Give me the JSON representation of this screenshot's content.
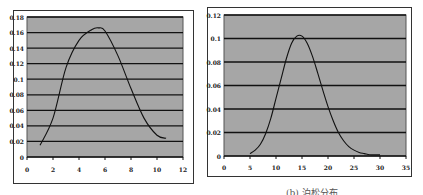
{
  "chart_data": [
    {
      "type": "line",
      "title": "",
      "xlabel": "",
      "ylabel": "",
      "xlim": [
        0,
        12
      ],
      "ylim": [
        0,
        0.18
      ],
      "x_ticks": [
        "0",
        "2",
        "4",
        "6",
        "8",
        "10",
        "12"
      ],
      "y_ticks": [
        "0",
        "0.02",
        "0.04",
        "0.06",
        "0.08",
        "0.1",
        "0.12",
        "0.14",
        "0.16",
        "0.18"
      ],
      "grid": "horizontal",
      "background": "#a6a6a6",
      "series": [
        {
          "name": "",
          "x": [
            1,
            2,
            3,
            4,
            5,
            5.5,
            6,
            7,
            8,
            9,
            10,
            10.7
          ],
          "values": [
            0.015,
            0.05,
            0.115,
            0.15,
            0.164,
            0.166,
            0.162,
            0.13,
            0.088,
            0.05,
            0.028,
            0.024
          ]
        }
      ]
    },
    {
      "type": "line",
      "title": "",
      "xlabel": "",
      "ylabel": "",
      "xlim": [
        0,
        35
      ],
      "ylim": [
        0,
        0.12
      ],
      "x_ticks": [
        "0",
        "5",
        "10",
        "15",
        "20",
        "25",
        "30",
        "35"
      ],
      "y_ticks": [
        "0",
        "0.02",
        "0.04",
        "0.06",
        "0.08",
        "0.1",
        "0.12"
      ],
      "grid": "horizontal",
      "background": "#a6a6a6",
      "series": [
        {
          "name": "",
          "x": [
            5,
            6,
            7,
            8,
            9,
            10,
            11,
            12,
            13,
            14,
            15,
            16,
            17,
            18,
            19,
            20,
            21,
            22,
            23,
            24,
            25,
            26,
            27,
            28,
            29,
            30
          ],
          "values": [
            0.002,
            0.005,
            0.01,
            0.019,
            0.032,
            0.049,
            0.066,
            0.083,
            0.096,
            0.102,
            0.102,
            0.096,
            0.085,
            0.071,
            0.056,
            0.042,
            0.03,
            0.02,
            0.013,
            0.008,
            0.005,
            0.003,
            0.002,
            0.001,
            0.001,
            0.001
          ]
        }
      ]
    }
  ],
  "caption": "(b) 泊松分布"
}
